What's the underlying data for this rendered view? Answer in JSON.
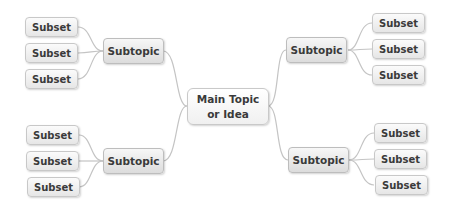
{
  "diagram": {
    "type": "mind-map",
    "colors": {
      "line": "#c4c4c4",
      "node_border": "#c8c8c8",
      "text": "#3a3a3a"
    },
    "main": {
      "line1": "Main Topic",
      "line2": "or Idea"
    },
    "branches": [
      {
        "position": "top-left",
        "label": "Subtopic",
        "subsets": [
          "Subset",
          "Subset",
          "Subset"
        ]
      },
      {
        "position": "top-right",
        "label": "Subtopic",
        "subsets": [
          "Subset",
          "Subset",
          "Subset"
        ]
      },
      {
        "position": "bottom-left",
        "label": "Subtopic",
        "subsets": [
          "Subset",
          "Subset",
          "Subset"
        ]
      },
      {
        "position": "bottom-right",
        "label": "Subtopic",
        "subsets": [
          "Subset",
          "Subset",
          "Subset"
        ]
      }
    ]
  }
}
